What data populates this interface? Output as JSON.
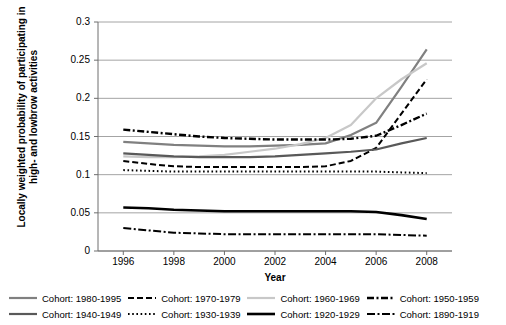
{
  "chart_data": {
    "type": "line",
    "title": "",
    "xlabel": "Year",
    "ylabel": "Locally weighted probability of participating in high- and lowbrow activities",
    "x": [
      1996,
      1997,
      1998,
      1999,
      2000,
      2001,
      2002,
      2003,
      2004,
      2005,
      2006,
      2007,
      2008
    ],
    "xticks": [
      "1996",
      "1998",
      "2000",
      "2002",
      "2004",
      "2006",
      "2008"
    ],
    "xlim": [
      1995,
      2009
    ],
    "ylim": [
      0,
      0.3
    ],
    "yticks": [
      "0",
      "0.05",
      "0.1",
      "0.15",
      "0.2",
      "0.25",
      "0.3"
    ],
    "grid": "horizontal",
    "legend_position": "bottom",
    "series": [
      {
        "name": "Cohort: 1980-1995",
        "style": "solid",
        "color": "#808080",
        "width": 2.2,
        "values": [
          0.143,
          0.141,
          0.139,
          0.138,
          0.137,
          0.137,
          0.138,
          0.139,
          0.141,
          0.152,
          0.168,
          0.215,
          0.264
        ]
      },
      {
        "name": "Cohort: 1970-1979",
        "style": "dashed",
        "color": "#000000",
        "width": 2.0,
        "values": [
          0.118,
          0.114,
          0.111,
          0.11,
          0.11,
          0.11,
          0.11,
          0.11,
          0.111,
          0.118,
          0.135,
          0.18,
          0.225
        ]
      },
      {
        "name": "Cohort: 1960-1969",
        "style": "solid",
        "color": "#c8c8c8",
        "width": 2.2,
        "values": [
          0.124,
          0.123,
          0.123,
          0.124,
          0.126,
          0.13,
          0.134,
          0.14,
          0.148,
          0.165,
          0.2,
          0.225,
          0.246
        ]
      },
      {
        "name": "Cohort: 1950-1959",
        "style": "dash-dot-thick",
        "color": "#000000",
        "width": 2.4,
        "values": [
          0.159,
          0.156,
          0.153,
          0.15,
          0.148,
          0.147,
          0.146,
          0.146,
          0.146,
          0.147,
          0.151,
          0.165,
          0.18
        ]
      },
      {
        "name": "Cohort: 1940-1949",
        "style": "solid",
        "color": "#595959",
        "width": 2.2,
        "values": [
          0.128,
          0.126,
          0.124,
          0.123,
          0.123,
          0.123,
          0.124,
          0.126,
          0.128,
          0.13,
          0.133,
          0.141,
          0.148
        ]
      },
      {
        "name": "Cohort: 1930-1939",
        "style": "dotted",
        "color": "#000000",
        "width": 2.0,
        "values": [
          0.106,
          0.105,
          0.104,
          0.104,
          0.104,
          0.104,
          0.104,
          0.104,
          0.104,
          0.104,
          0.104,
          0.103,
          0.102
        ]
      },
      {
        "name": "Cohort: 1920-1929",
        "style": "solid",
        "color": "#000000",
        "width": 2.6,
        "values": [
          0.057,
          0.056,
          0.054,
          0.053,
          0.052,
          0.052,
          0.052,
          0.052,
          0.052,
          0.052,
          0.051,
          0.047,
          0.042
        ]
      },
      {
        "name": "Cohort: 1890-1919",
        "style": "dash-dot-thin",
        "color": "#000000",
        "width": 2.0,
        "values": [
          0.03,
          0.027,
          0.024,
          0.023,
          0.022,
          0.022,
          0.022,
          0.022,
          0.022,
          0.022,
          0.022,
          0.021,
          0.02
        ]
      }
    ]
  },
  "legend": {
    "rows": [
      [
        {
          "label": "Cohort: 1980-1995",
          "style": "solid",
          "color": "#808080"
        },
        {
          "label": "Cohort: 1970-1979",
          "style": "dashed",
          "color": "#000000"
        },
        {
          "label": "Cohort: 1960-1969",
          "style": "solid",
          "color": "#c8c8c8"
        },
        {
          "label": "Cohort: 1950-1959",
          "style": "dash-dot-thick",
          "color": "#000000"
        }
      ],
      [
        {
          "label": "Cohort: 1940-1949",
          "style": "solid",
          "color": "#595959"
        },
        {
          "label": "Cohort: 1930-1939",
          "style": "dotted",
          "color": "#000000"
        },
        {
          "label": "Cohort: 1920-1929",
          "style": "solid",
          "color": "#000000"
        },
        {
          "label": "Cohort: 1890-1919",
          "style": "dash-dot-thin",
          "color": "#000000"
        }
      ]
    ]
  }
}
